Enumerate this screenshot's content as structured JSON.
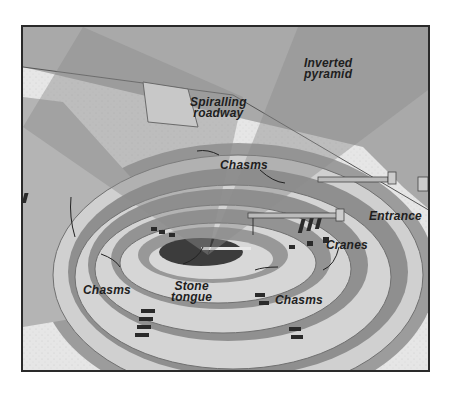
{
  "diagram": {
    "labels": {
      "inverted_pyramid": [
        "Inverted",
        "pyramid"
      ],
      "spiralling_roadway": [
        "Spiralling",
        "roadway"
      ],
      "chasms_top": "Chasms",
      "entrance": "Entrance",
      "cranes": "Cranes",
      "chasms_left": "Chasms",
      "stone_tongue": [
        "Stone",
        "tongue"
      ],
      "chasms_right": "Chasms"
    },
    "colors": {
      "frame_border": "#2a2a2a",
      "ground": "#e4e4e4",
      "pyramid_beam": "#9a9a9a",
      "ring_light": "#d2d2d2",
      "ring_dark": "#8e8e8e",
      "pit_floor": "#3a3a3a",
      "chasm": "#2a2a2a"
    }
  }
}
